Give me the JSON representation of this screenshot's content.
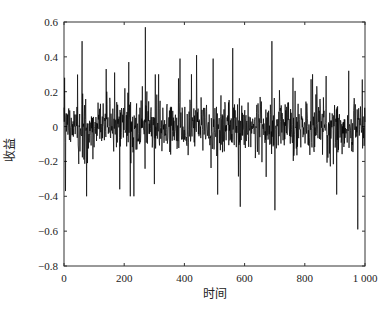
{
  "chart_data": {
    "type": "line",
    "title": "",
    "xlabel": "时间",
    "ylabel": "收益",
    "xlim": [
      0,
      1000
    ],
    "ylim": [
      -0.8,
      0.6
    ],
    "xticks": [
      0,
      200,
      400,
      600,
      800,
      1000
    ],
    "xtick_labels": [
      "0",
      "200",
      "400",
      "600",
      "800",
      "1 000"
    ],
    "yticks": [
      0.6,
      0.4,
      0.2,
      0,
      -0.2,
      -0.4,
      -0.6,
      -0.8
    ],
    "ytick_labels": [
      "0.6",
      "0.4",
      "0.2",
      "0",
      "−0.2",
      "−0.4",
      "−0.6",
      "−0.8"
    ],
    "grid": false,
    "legend": null,
    "series": [
      {
        "name": "收益",
        "color": "#000000",
        "n_points": 1000,
        "description": "Return series oscillating around 0, typical amplitude about ±0.15, with sporadic spikes",
        "notable_points": [
          {
            "x": 2,
            "y": 0.28
          },
          {
            "x": 5,
            "y": -0.37
          },
          {
            "x": 60,
            "y": 0.49
          },
          {
            "x": 75,
            "y": -0.4
          },
          {
            "x": 140,
            "y": 0.33
          },
          {
            "x": 168,
            "y": 0.31
          },
          {
            "x": 185,
            "y": -0.36
          },
          {
            "x": 215,
            "y": 0.37
          },
          {
            "x": 220,
            "y": -0.4
          },
          {
            "x": 232,
            "y": -0.4
          },
          {
            "x": 270,
            "y": 0.57
          },
          {
            "x": 300,
            "y": -0.33
          },
          {
            "x": 385,
            "y": 0.39
          },
          {
            "x": 440,
            "y": 0.41
          },
          {
            "x": 495,
            "y": 0.39
          },
          {
            "x": 510,
            "y": -0.39
          },
          {
            "x": 560,
            "y": 0.45
          },
          {
            "x": 585,
            "y": -0.46
          },
          {
            "x": 690,
            "y": 0.49
          },
          {
            "x": 700,
            "y": -0.48
          },
          {
            "x": 760,
            "y": 0.28
          },
          {
            "x": 870,
            "y": 0.29
          },
          {
            "x": 905,
            "y": -0.39
          },
          {
            "x": 945,
            "y": 0.32
          },
          {
            "x": 975,
            "y": -0.59
          },
          {
            "x": 990,
            "y": 0.27
          }
        ],
        "seed": 7,
        "base_sigma": 0.075
      }
    ],
    "plot_area_px": {
      "left": 64,
      "top": 22,
      "right": 365,
      "bottom": 266
    }
  }
}
